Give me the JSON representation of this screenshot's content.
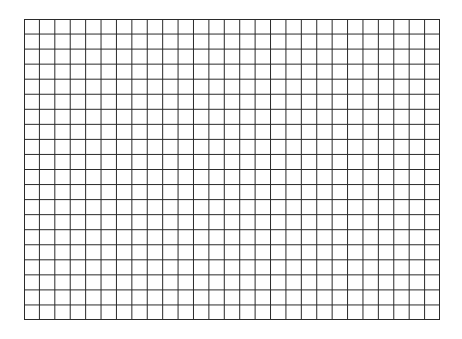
{
  "grid": {
    "columns": 27,
    "rows": 20,
    "left": 24,
    "top": 19,
    "width": 416,
    "height": 301,
    "line_color": "#2b2b2b",
    "background_color": "#ffffff"
  }
}
